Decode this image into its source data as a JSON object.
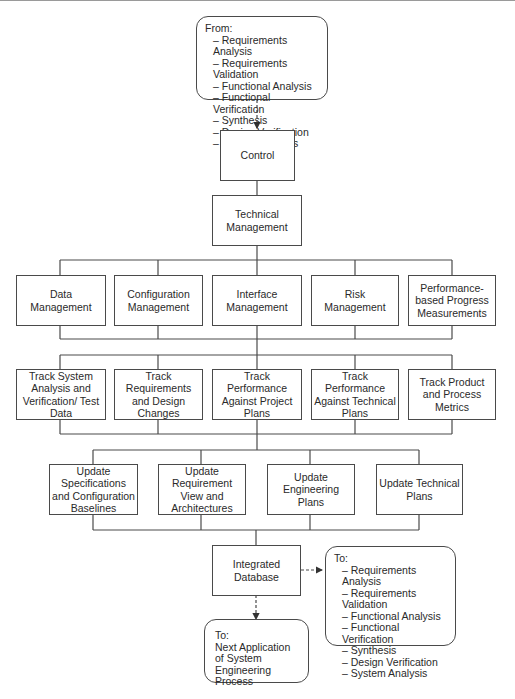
{
  "diagram": {
    "from_box": {
      "heading": "From:",
      "items": [
        "Requirements Analysis",
        "Requirements Validation",
        "Functional Analysis",
        "Functional Verification",
        "Synthesis",
        "Design Verification",
        "System Analysis"
      ]
    },
    "control": "Control",
    "technical_management": "Technical Management",
    "management_row": [
      "Data Management",
      "Configuration Management",
      "Interface Management",
      "Risk Management",
      "Performance-based Progress Measurements"
    ],
    "track_row": [
      "Track System Analysis and Verification/ Test Data",
      "Track Requirements and Design Changes",
      "Track Performance Against Project Plans",
      "Track Performance Against Technical Plans",
      "Track Product and Process Metrics"
    ],
    "update_row": [
      "Update Specifications and Configuration Baselines",
      "Update Requirement View and Architectures",
      "Update Engineering Plans",
      "Update Technical Plans"
    ],
    "integrated_database": "Integrated Database",
    "to_box": {
      "heading": "To:",
      "items": [
        "Requirements Analysis",
        "Requirements Validation",
        "Functional Analysis",
        "Functional Verification",
        "Synthesis",
        "Design Verification",
        "System Analysis"
      ]
    },
    "next_box": {
      "heading": "To:",
      "text": "Next Application of System Engineering Process"
    }
  }
}
